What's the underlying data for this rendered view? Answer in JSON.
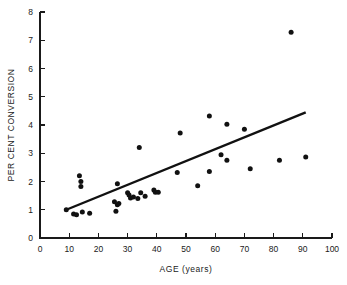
{
  "chart_data": {
    "type": "scatter",
    "title": "",
    "xlabel": "AGE (years)",
    "ylabel": "PER CENT CONVERSION",
    "xlim": [
      0,
      100
    ],
    "ylim": [
      0,
      8
    ],
    "xticks": [
      0,
      10,
      20,
      30,
      40,
      50,
      60,
      70,
      80,
      90,
      100
    ],
    "xtick_labels": [
      "0",
      "10",
      "20",
      "30",
      "40",
      "50",
      "60",
      "70",
      "80",
      "90",
      "100"
    ],
    "yticks": [
      0,
      1,
      2,
      3,
      4,
      5,
      6,
      7,
      8
    ],
    "ytick_labels": [
      "0",
      "1",
      "2",
      "3",
      "4",
      "5",
      "6",
      "7",
      "8"
    ],
    "grid": false,
    "legend": null,
    "marker": "filled-circle",
    "marker_color": "#111111",
    "points": [
      {
        "x": 9,
        "y": 1.0
      },
      {
        "x": 11.5,
        "y": 0.85
      },
      {
        "x": 12.5,
        "y": 0.82
      },
      {
        "x": 13.5,
        "y": 2.2
      },
      {
        "x": 14,
        "y": 2.0
      },
      {
        "x": 14,
        "y": 1.82
      },
      {
        "x": 14.5,
        "y": 0.92
      },
      {
        "x": 17,
        "y": 0.88
      },
      {
        "x": 25.5,
        "y": 1.28
      },
      {
        "x": 26,
        "y": 0.95
      },
      {
        "x": 26.5,
        "y": 1.18
      },
      {
        "x": 27,
        "y": 1.22
      },
      {
        "x": 26.5,
        "y": 1.92
      },
      {
        "x": 30,
        "y": 1.6
      },
      {
        "x": 30.5,
        "y": 1.52
      },
      {
        "x": 31,
        "y": 1.42
      },
      {
        "x": 32,
        "y": 1.45
      },
      {
        "x": 33.5,
        "y": 1.4
      },
      {
        "x": 34,
        "y": 3.2
      },
      {
        "x": 34.5,
        "y": 1.6
      },
      {
        "x": 36,
        "y": 1.48
      },
      {
        "x": 39,
        "y": 1.7
      },
      {
        "x": 39.5,
        "y": 1.62
      },
      {
        "x": 40.5,
        "y": 1.62
      },
      {
        "x": 47,
        "y": 2.32
      },
      {
        "x": 48,
        "y": 3.72
      },
      {
        "x": 54,
        "y": 1.85
      },
      {
        "x": 58,
        "y": 2.35
      },
      {
        "x": 58,
        "y": 4.32
      },
      {
        "x": 62,
        "y": 2.95
      },
      {
        "x": 64,
        "y": 4.03
      },
      {
        "x": 64,
        "y": 2.75
      },
      {
        "x": 70,
        "y": 3.85
      },
      {
        "x": 72,
        "y": 2.45
      },
      {
        "x": 82,
        "y": 2.75
      },
      {
        "x": 86,
        "y": 7.28
      },
      {
        "x": 91,
        "y": 2.87
      }
    ],
    "trend_line": {
      "x1": 9,
      "y1": 1.0,
      "x2": 91,
      "y2": 4.45,
      "color": "#111111"
    }
  }
}
